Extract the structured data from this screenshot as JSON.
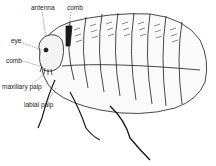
{
  "diagram": {
    "labels": [
      {
        "id": "antenna",
        "text": "antenna",
        "x": 31,
        "y": 5
      },
      {
        "id": "comb-top",
        "text": "comb",
        "x": 67,
        "y": 5
      },
      {
        "id": "eye",
        "text": "eye",
        "x": 11,
        "y": 38
      },
      {
        "id": "comb-side",
        "text": "comb",
        "x": 6,
        "y": 58
      },
      {
        "id": "maxillary-palp",
        "text": "maxillary palp",
        "x": 2,
        "y": 84
      },
      {
        "id": "labial-palp",
        "text": "labial palp",
        "x": 24,
        "y": 102
      }
    ],
    "colors": {
      "ink": "#1a1a1a",
      "background": "#ffffff"
    }
  }
}
